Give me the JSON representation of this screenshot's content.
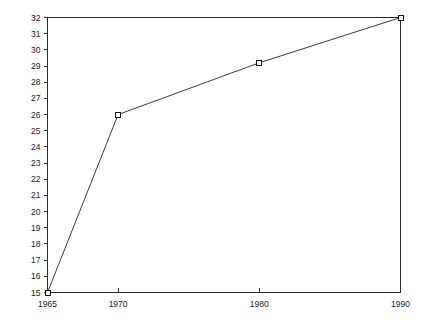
{
  "chart_data": {
    "type": "line",
    "title": "",
    "subtitle": "",
    "xlabel": "",
    "ylabel": "",
    "x": [
      1965,
      1970,
      1980,
      1990
    ],
    "values": [
      15,
      26,
      29.2,
      32
    ],
    "series": [
      {
        "name": "",
        "x": [
          1965,
          1970,
          1980,
          1990
        ],
        "values": [
          15,
          26,
          29.2,
          32
        ]
      }
    ],
    "xlim": [
      1965,
      1990
    ],
    "ylim": [
      15,
      32
    ],
    "x_ticks": [
      1965,
      1970,
      1980,
      1990
    ],
    "x_tick_labels": [
      "1965",
      "1970",
      "1980",
      "1990"
    ],
    "y_ticks": [
      15,
      16,
      17,
      18,
      19,
      20,
      21,
      22,
      23,
      24,
      25,
      26,
      27,
      28,
      29,
      30,
      31,
      32
    ],
    "y_tick_labels": [
      "15",
      "16",
      "17",
      "18",
      "19",
      "20",
      "21",
      "22",
      "23",
      "24",
      "25",
      "26",
      "27",
      "28",
      "29",
      "30",
      "31",
      "32"
    ],
    "grid": false,
    "legend": false,
    "legend_position": "none",
    "marker": "open-square",
    "annotations": [],
    "colors": {
      "background": "#ffffff",
      "line": "#3a3a3a",
      "axis": "#2b2b2b",
      "marker_fill": "#ffffff",
      "marker_stroke": "#151515",
      "text": "#1a1a1a"
    }
  }
}
